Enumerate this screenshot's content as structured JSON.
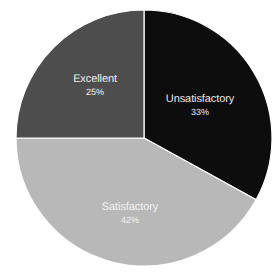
{
  "background_color": "#ffffff",
  "chart_data": {
    "type": "pie",
    "title": "",
    "subtitle": "",
    "xlabel": "",
    "ylabel": "",
    "grid": false,
    "legend": "none",
    "label_position": "inside-slice",
    "start_angle_deg": 0,
    "direction": "clockwise",
    "center_x": 144,
    "center_y": 138,
    "radius": 128,
    "categories": [
      "Unsatisfactory",
      "Satisfactory",
      "Excellent"
    ],
    "values": [
      33,
      42,
      25
    ],
    "value_unit": "%",
    "colors": [
      "#0d0d0d",
      "#b8b8b8",
      "#4d4d4d"
    ],
    "slices": [
      {
        "label": "Unsatisfactory",
        "value": 33,
        "value_text": "33%",
        "color": "#0d0d0d",
        "text_color": "#e8e8e8",
        "start_deg": 0,
        "end_deg": 118.8,
        "label_x": 200,
        "label_y": 105
      },
      {
        "label": "Satisfactory",
        "value": 42,
        "value_text": "42%",
        "color": "#b8b8b8",
        "text_color": "#f2f2f2",
        "start_deg": 118.8,
        "end_deg": 270.0,
        "label_x": 130,
        "label_y": 213
      },
      {
        "label": "Excellent",
        "value": 25,
        "value_text": "25%",
        "color": "#4d4d4d",
        "text_color": "#efefef",
        "start_deg": 270.0,
        "end_deg": 360.0,
        "label_x": 95,
        "label_y": 85
      }
    ]
  }
}
